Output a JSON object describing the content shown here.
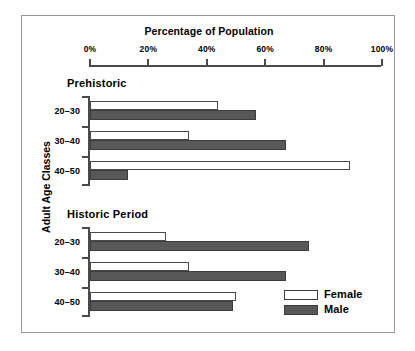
{
  "chart_data": {
    "type": "bar",
    "orientation": "horizontal",
    "title": "Percentage of Population",
    "xlabel": "Percentage of Population",
    "ylabel": "Adult Age Classes",
    "xlim": [
      0,
      100
    ],
    "xticks": [
      0,
      20,
      40,
      60,
      80,
      100
    ],
    "xtick_labels": [
      "0%",
      "20%",
      "40%",
      "60%",
      "80%",
      "100%"
    ],
    "grid": false,
    "legend": {
      "position": "bottom-right",
      "entries": [
        {
          "name": "Female",
          "color": "#ffffff"
        },
        {
          "name": "Male",
          "color": "#585858"
        }
      ]
    },
    "categories": [
      "20–30",
      "30–40",
      "40–50"
    ],
    "groups": [
      {
        "label": "Prehistoric",
        "series": [
          {
            "name": "Female",
            "values": [
              44,
              34,
              89
            ]
          },
          {
            "name": "Male",
            "values": [
              57,
              67,
              13
            ]
          }
        ]
      },
      {
        "label": "Historic Period",
        "series": [
          {
            "name": "Female",
            "values": [
              26,
              34,
              50
            ]
          },
          {
            "name": "Male",
            "values": [
              75,
              67,
              49
            ]
          }
        ]
      }
    ]
  },
  "colors": {
    "female_fill": "#ffffff",
    "male_fill": "#585858",
    "axis": "#4a4a4a",
    "border": "#9a9a9a",
    "text": "#000000"
  }
}
